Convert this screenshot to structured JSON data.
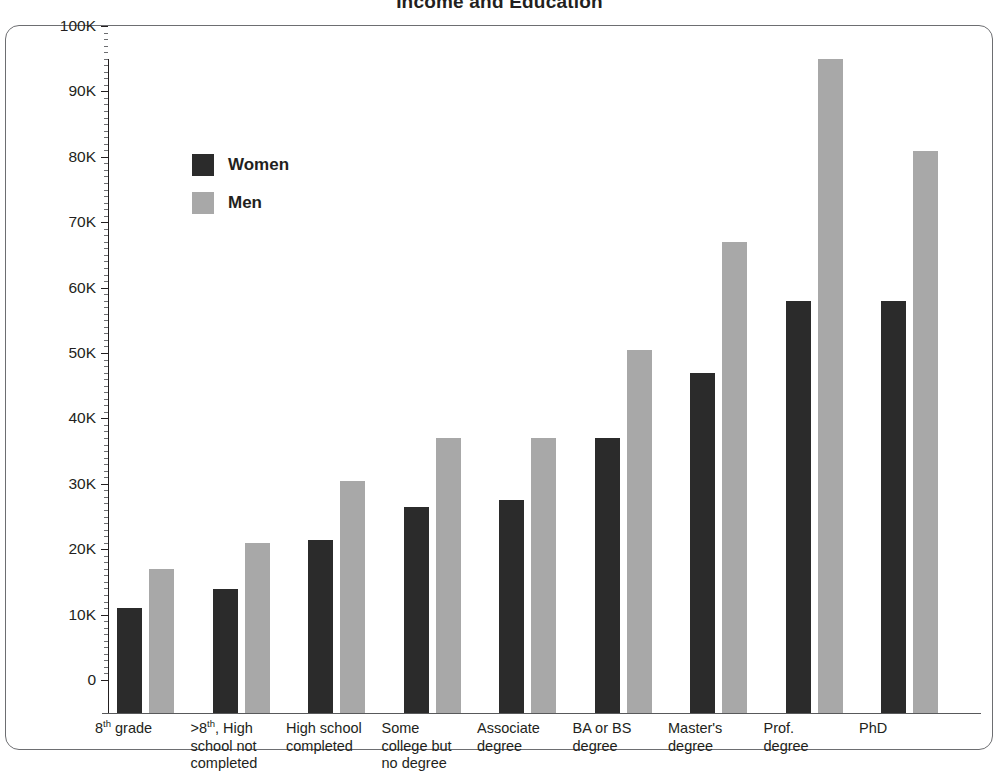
{
  "chart_data": {
    "type": "bar",
    "title": "Income and Education",
    "xlabel": "",
    "ylabel": "",
    "ylim": [
      0,
      100000
    ],
    "y_tick_labels": [
      "0",
      "10K",
      "20K",
      "30K",
      "40K",
      "50K",
      "60K",
      "70K",
      "80K",
      "90K",
      "100K"
    ],
    "y_tick_values": [
      0,
      10000,
      20000,
      30000,
      40000,
      50000,
      60000,
      70000,
      80000,
      90000,
      100000
    ],
    "y_minor_tick_step": 1000,
    "grid": false,
    "legend_position": "upper-left-inside",
    "categories": [
      "8th grade",
      ">8th, High school not completed",
      "High school completed",
      "Some college but no degree",
      "Associate degree",
      "BA or BS degree",
      "Master's degree",
      "Prof. degree",
      "PhD"
    ],
    "category_label_lines": [
      [
        "8|th| grade"
      ],
      [
        ">8|th|, High",
        "school not",
        "completed"
      ],
      [
        "High school",
        "completed"
      ],
      [
        "Some",
        "college but",
        "no degree"
      ],
      [
        "Associate",
        "degree"
      ],
      [
        "BA or BS",
        "degree"
      ],
      [
        "Master's",
        "degree"
      ],
      [
        "Prof.",
        "degree"
      ],
      [
        "PhD"
      ]
    ],
    "series": [
      {
        "name": "Women",
        "color": "#2b2b2b",
        "values": [
          16000,
          19000,
          26500,
          31500,
          32500,
          42000,
          52000,
          63000,
          63000
        ]
      },
      {
        "name": "Men",
        "color": "#a8a8a8",
        "values": [
          22000,
          26000,
          35500,
          42000,
          42000,
          55500,
          72000,
          100000,
          86000
        ]
      }
    ]
  },
  "legend": {
    "items": [
      {
        "label": "Women",
        "color": "#2b2b2b"
      },
      {
        "label": "Men",
        "color": "#a8a8a8"
      }
    ]
  },
  "axis_colors": {
    "axis_line": "#231f20",
    "frame_border": "#6d6e71",
    "text": "#231f20"
  }
}
